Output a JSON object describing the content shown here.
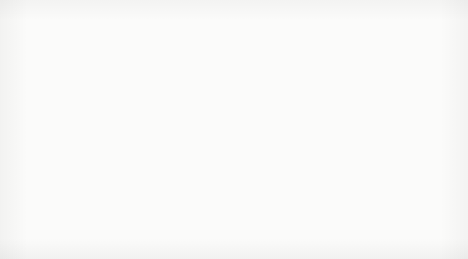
{
  "legend": {
    "prefix": "K:",
    "entries": [
      "1",
      "2",
      "3"
    ],
    "separator": "-"
  },
  "scale_labels": [
    "1:",
    "1:",
    "1:"
  ],
  "axes": {
    "y": {
      "ticks": [
        "1.00",
        "0.50",
        "0.00"
      ],
      "minor_ticks": [
        "0.75",
        "0.25"
      ],
      "min": 0.0,
      "max": 1.0
    },
    "x": {
      "label": "Time",
      "ticks": [
        "0",
        "25",
        "50",
        "75",
        "100"
      ],
      "min": 0,
      "max": 100
    }
  },
  "chart_data": {
    "type": "line",
    "title": "K: 1 - 2 - 3",
    "xlabel": "Time",
    "ylabel": "",
    "xlim": [
      0,
      100
    ],
    "ylim": [
      0,
      1
    ],
    "grid": true,
    "grid_style": "dotted-horizontal-at-1.00-0.75-0.50-0.25, light-vertical-at-25-50-75-100",
    "legend_position": "top-left",
    "x": [
      0,
      1,
      2,
      3,
      4,
      5,
      6,
      7,
      8,
      10,
      12,
      15,
      20,
      25,
      30,
      40,
      50,
      60,
      70,
      75,
      80,
      90,
      100
    ],
    "series": [
      {
        "name": "1",
        "label": "1",
        "color": "#9a9a9a",
        "style": "solid",
        "values": [
          0.0,
          0.095,
          0.112,
          0.104,
          0.094,
          0.086,
          0.08,
          0.075,
          0.071,
          0.065,
          0.06,
          0.055,
          0.049,
          0.045,
          0.042,
          0.039,
          0.037,
          0.035,
          0.034,
          0.034,
          0.033,
          0.032,
          0.031
        ],
        "marker_labels_at_x": [
          3,
          25,
          50,
          75
        ],
        "description": "brief early spike to ~0.11 then monotone decay toward ~0.03"
      },
      {
        "name": "2",
        "label": "2",
        "color": "#8e8e8e",
        "style": "dotted",
        "values": [
          0.0,
          0.1,
          0.29,
          0.42,
          0.48,
          0.505,
          0.516,
          0.519,
          0.521,
          0.522,
          0.523,
          0.524,
          0.525,
          0.526,
          0.527,
          0.528,
          0.529,
          0.53,
          0.531,
          0.531,
          0.532,
          0.532,
          0.533
        ],
        "marker_labels_at_x": [
          6,
          25,
          50,
          75
        ],
        "description": "rapid rise to ~0.52 by t=6, then flat plateau drifting to ~0.53"
      },
      {
        "name": "3",
        "label": "3",
        "color": "#a5a5a5",
        "style": "solid-oscillating",
        "mean": 0.71,
        "amplitude": 0.07,
        "period": 2.1,
        "values": [
          0.0,
          0.3,
          0.68,
          0.78,
          0.66,
          0.77,
          0.65,
          0.77,
          0.66,
          0.76,
          0.66,
          0.76,
          0.67,
          0.76,
          0.67,
          0.75,
          0.68,
          0.75,
          0.68,
          0.74,
          0.68,
          0.74,
          0.69
        ],
        "marker_labels_at_x": [
          11,
          44,
          66,
          90
        ],
        "description": "rises to ~0.78 by t=3 then sustained oscillation between ~0.64 and ~0.78 about a mean of ~0.71"
      }
    ]
  }
}
